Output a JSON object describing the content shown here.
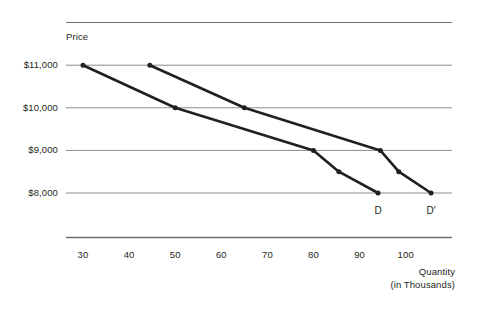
{
  "chart_data": {
    "type": "line",
    "title": "",
    "xlabel": "Quantity (in Thousands)",
    "ylabel": "Price",
    "xlim": [
      20,
      112
    ],
    "ylim": [
      7600,
      11450
    ],
    "grid": true,
    "legend": "none",
    "xticks": [
      30,
      40,
      50,
      60,
      70,
      80,
      90,
      100
    ],
    "xtick_labels": [
      "30",
      "40",
      "50",
      "60",
      "70",
      "80",
      "90",
      "100"
    ],
    "yticks": [
      8000,
      9000,
      10000,
      11000
    ],
    "ytick_labels": [
      "$8,000",
      "$9,000",
      "$10,000",
      "$11,000"
    ],
    "series": [
      {
        "name": "D",
        "label": "D",
        "color": "#231f20",
        "points": [
          {
            "x": 30,
            "y": 11000
          },
          {
            "x": 50,
            "y": 10000
          },
          {
            "x": 80,
            "y": 9000
          },
          {
            "x": 85.5,
            "y": 8500
          },
          {
            "x": 94,
            "y": 8000
          }
        ]
      },
      {
        "name": "D'",
        "label": "D′",
        "color": "#231f20",
        "points": [
          {
            "x": 44.5,
            "y": 11000
          },
          {
            "x": 65,
            "y": 10000
          },
          {
            "x": 94.5,
            "y": 9000
          },
          {
            "x": 98.5,
            "y": 8500
          },
          {
            "x": 105.5,
            "y": 8000
          }
        ]
      }
    ]
  },
  "axes": {
    "price_label": "Price",
    "quantity_label_line1": "Quantity",
    "quantity_label_line2": "(in Thousands)"
  },
  "curve_labels": [
    {
      "text": "D",
      "x": 94,
      "y": 7750
    },
    {
      "text": "D′",
      "x": 105.5,
      "y": 7750
    }
  ],
  "colors": {
    "line": "#231f20",
    "grid": "#8c8c8c",
    "axis": "#6e6e6e",
    "text": "#231f20",
    "background": "#ffffff"
  }
}
